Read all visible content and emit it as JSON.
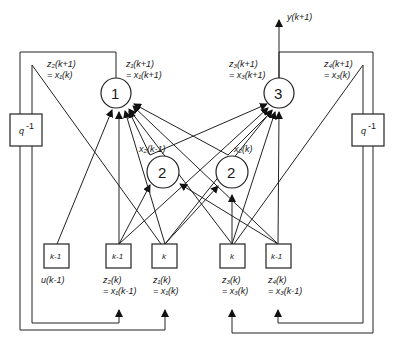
{
  "diagram": {
    "type": "recurrent neural network (state-space) block diagram",
    "nodes": {
      "n1": {
        "label": "1"
      },
      "n2a": {
        "label": "2"
      },
      "n2b": {
        "label": "2"
      },
      "n3": {
        "label": "3"
      }
    },
    "delay_blocks": {
      "left": {
        "label": "q",
        "sup": "-1"
      },
      "right": {
        "label": "q",
        "sup": "-1"
      }
    },
    "input_boxes": [
      {
        "label": "k-1",
        "caption1": "u(k-1)",
        "caption2": ""
      },
      {
        "label": "k-1",
        "caption1": "z₂(k)",
        "caption2": "= x₁(k-1)"
      },
      {
        "label": "k",
        "caption1": "z₁(k)",
        "caption2": "= x₁(k)"
      },
      {
        "label": "k",
        "caption1": "z₃(k)",
        "caption2": "= x₃(k)"
      },
      {
        "label": "k-1",
        "caption1": "z₄(k)",
        "caption2": "= x₃(k-1)"
      }
    ],
    "top_labels": {
      "z2": {
        "line1": "z₂(k+1)",
        "line2": "= x₁(k)"
      },
      "z1": {
        "line1": "z₁(k+1)",
        "line2": "= x₁(k+1)"
      },
      "z3": {
        "line1": "z₃(k+1)",
        "line2": "= x₃(k+1)"
      },
      "z4": {
        "line1": "z₄(k+1)",
        "line2": "= x₃(k)"
      }
    },
    "hidden_labels": {
      "left": "x₂(k-1)",
      "right": "x₂(k)"
    },
    "output_label": "y(k+1)"
  }
}
